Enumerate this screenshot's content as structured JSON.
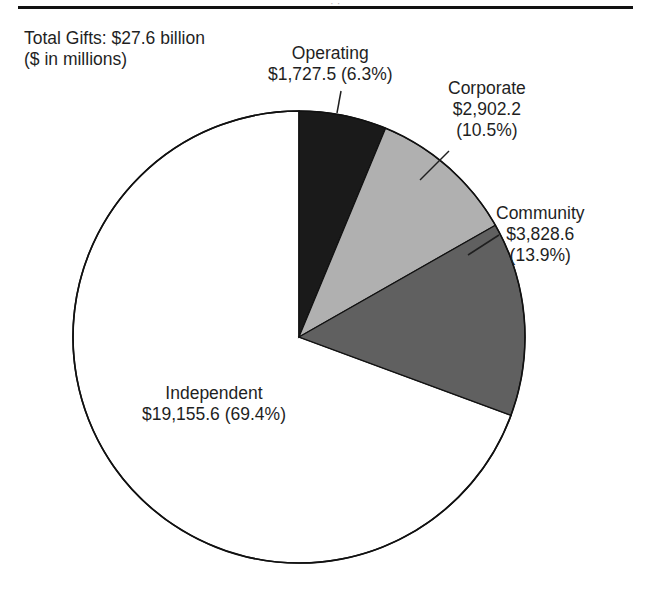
{
  "figure": {
    "width": 645,
    "height": 604,
    "background": "#ffffff",
    "header_ghost": "· ·"
  },
  "caption": {
    "line1": "Total Gifts: $27.6 billion",
    "line2": "($ in millions)"
  },
  "labels": {
    "operating": {
      "name": "Operating",
      "value_pct": "$1,727.5 (6.3%)"
    },
    "corporate": {
      "name": "Corporate",
      "value": "$2,902.2",
      "pct": "(10.5%)"
    },
    "community": {
      "name": "Community",
      "value": "$3,828.6",
      "pct": "(13.9%)"
    },
    "independent": {
      "name": "Independent",
      "value_pct": "$19,155.6 (69.4%)"
    }
  },
  "chart_data": {
    "type": "pie",
    "title": "Total Gifts: $27.6 billion",
    "subtitle": "($ in millions)",
    "units": "millions of dollars",
    "total": 27613.9,
    "total_display": "$27.6 billion",
    "start_angle_deg": 0,
    "direction": "clockwise",
    "legend": "none (direct labels with leader lines)",
    "labels": [
      "Operating",
      "Corporate",
      "Community",
      "Independent"
    ],
    "values": [
      1727.5,
      2902.2,
      3828.6,
      19155.6
    ],
    "value_labels": [
      "$1,727.5",
      "$2,902.2",
      "$3,828.6",
      "$19,155.6"
    ],
    "percents": [
      6.3,
      10.5,
      13.9,
      69.4
    ],
    "percent_labels": [
      "(6.3%)",
      "(10.5%)",
      "(13.9%)",
      "(69.4%)"
    ],
    "colors": [
      "#1a1a1a",
      "#b0b0b0",
      "#606060",
      "#ffffff"
    ],
    "slice_edge_color": "#111111",
    "geometry": {
      "center_x": 299,
      "center_y": 337,
      "radius": 226
    }
  }
}
